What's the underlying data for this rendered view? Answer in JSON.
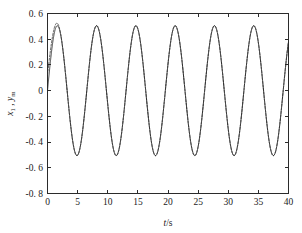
{
  "chart_data": {
    "type": "line",
    "title": "",
    "subtitle": "",
    "xlabel": "t/s",
    "xlabel_parts": {
      "italic": "t",
      "rest": "/s"
    },
    "ylabel": "x1, ym",
    "ylabel_parts": {
      "var1": "x",
      "var1_sub": "1",
      "separator": ",",
      "var2": "y",
      "var2_sub": "m"
    },
    "xlim": [
      0,
      40
    ],
    "ylim": [
      -0.8,
      0.6
    ],
    "xticks": [
      0,
      5,
      10,
      15,
      20,
      25,
      30,
      35,
      40
    ],
    "xticklabels": [
      "0",
      "5",
      "10",
      "15",
      "20",
      "25",
      "30",
      "35",
      "40"
    ],
    "yticks": [
      0.6,
      0.4,
      0.2,
      0,
      -0.2,
      -0.4,
      -0.6,
      -0.8
    ],
    "yticklabels": [
      "0. 6",
      "0. 4",
      "0. 2",
      "0",
      "-0. 2",
      "-0. 4",
      "-0. 6",
      "-0. 8"
    ],
    "grid": false,
    "legend": null,
    "legend_position": "none",
    "frame": "box",
    "tick_direction": "in",
    "series": [
      {
        "name": "x1",
        "style": "solid",
        "color": "#262626",
        "amplitude": 0.505,
        "period": 6.52,
        "phase_deg": 0,
        "description": "reference sinusoid starting at 0 rising, steady amplitude 0.505 over full 0-40 s range"
      },
      {
        "name": "ym",
        "style": "dashed",
        "color": "#333333",
        "amplitude": 0.505,
        "period": 6.52,
        "phase_deg": 0,
        "description": "tracking output, overshoots slightly above reference during 0-3 s transient reaching about 0.52, then coincides with x1"
      }
    ],
    "annotations": [
      {
        "text": "transient overshoot near first peak at t approximately 1.8 s",
        "x": 1.8,
        "y": 0.52
      }
    ],
    "peaks_t": [
      1.75,
      8.3,
      14.8,
      21.3,
      27.8,
      34.3,
      40.0
    ],
    "peaks_y": [
      0.5,
      0.5,
      0.5,
      0.5,
      0.5,
      0.5,
      0.5
    ],
    "troughs_t": [
      4.6,
      11.1,
      17.6,
      24.1,
      30.6,
      37.1
    ],
    "troughs_y": [
      -0.505,
      -0.505,
      -0.505,
      -0.505,
      -0.505,
      -0.505
    ]
  }
}
